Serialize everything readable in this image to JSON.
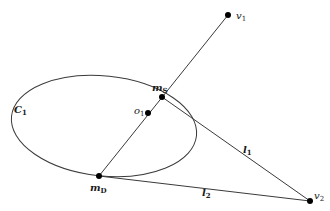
{
  "diagram": {
    "colors": {
      "stroke": "#3a3a3a",
      "point": "#000000",
      "background": "#ffffff"
    },
    "ellipse": {
      "label": "C",
      "label_sub": "1",
      "cx": 104,
      "cy": 126,
      "rx": 93,
      "ry": 50,
      "rotate": 6
    },
    "points": {
      "v1": {
        "label": "v",
        "sub": "1",
        "x": 228,
        "y": 15
      },
      "v2": {
        "label": "v",
        "sub": "2",
        "x": 310,
        "y": 201
      },
      "mS": {
        "label": "m",
        "sub": "S",
        "x": 162,
        "y": 97
      },
      "o1": {
        "label": "o",
        "sub": "1",
        "x": 148,
        "y": 113
      },
      "mD": {
        "label": "m",
        "sub": "D",
        "x": 99,
        "y": 176
      }
    },
    "lines": {
      "l1": {
        "label": "l",
        "sub": "1"
      },
      "l2": {
        "label": "l",
        "sub": "2"
      }
    }
  }
}
